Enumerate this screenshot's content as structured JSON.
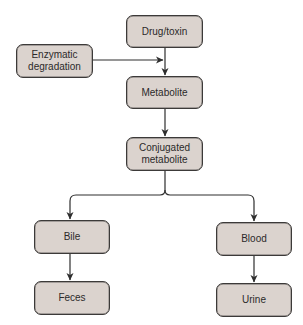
{
  "diagram": {
    "type": "flowchart",
    "colors": {
      "node_fill": "#dbd3ce",
      "node_border": "#3c3a39",
      "text": "#2b2a2a",
      "edge": "#2e2e2e"
    },
    "nodes": {
      "drug_toxin": {
        "label": "Drug/toxin"
      },
      "enzymatic_degradation": {
        "label": "Enzymatic\ndegradation"
      },
      "metabolite": {
        "label": "Metabolite"
      },
      "conjugated_metabolite": {
        "label": "Conjugated\nmetabolite"
      },
      "bile": {
        "label": "Bile"
      },
      "blood": {
        "label": "Blood"
      },
      "feces": {
        "label": "Feces"
      },
      "urine": {
        "label": "Urine"
      }
    },
    "edges": [
      {
        "from": "drug_toxin",
        "to": "metabolite"
      },
      {
        "from": "enzymatic_degradation",
        "to": "drug_toxin->metabolite"
      },
      {
        "from": "metabolite",
        "to": "conjugated_metabolite"
      },
      {
        "from": "conjugated_metabolite",
        "to": "bile"
      },
      {
        "from": "conjugated_metabolite",
        "to": "blood"
      },
      {
        "from": "bile",
        "to": "feces"
      },
      {
        "from": "blood",
        "to": "urine"
      }
    ]
  }
}
